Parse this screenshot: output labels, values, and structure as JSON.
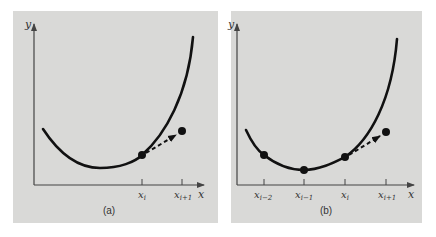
{
  "figure": {
    "background": "#ffffff",
    "panel_color": "#d9d9d7",
    "curve_color": "#111111",
    "axis_color": "#444444"
  },
  "panels": [
    {
      "id": "a",
      "caption": "(a)",
      "y_axis_label": "y",
      "x_axis_label": "x",
      "ticks": [
        {
          "label_main": "x",
          "label_sub": "i"
        },
        {
          "label_main": "x",
          "label_sub": "i+1"
        }
      ],
      "points": [
        "x_i (on curve)",
        "x_i+1 (extrapolated)"
      ],
      "arrow": "dashed from x_i to x_i+1"
    },
    {
      "id": "b",
      "caption": "(b)",
      "y_axis_label": "y",
      "x_axis_label": "x",
      "ticks": [
        {
          "label_main": "x",
          "label_sub": "i−2"
        },
        {
          "label_main": "x",
          "label_sub": "i−1"
        },
        {
          "label_main": "x",
          "label_sub": "i"
        },
        {
          "label_main": "x",
          "label_sub": "i+1"
        }
      ],
      "points": [
        "x_i-2",
        "x_i-1",
        "x_i (on curve)",
        "x_i+1 (extrapolated)"
      ],
      "arrow": "dashed from x_i to x_i+1"
    }
  ]
}
